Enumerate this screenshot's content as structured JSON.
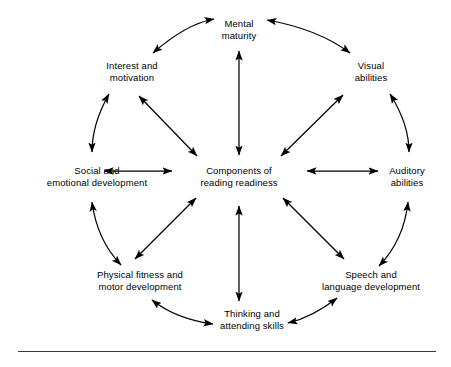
{
  "diagram": {
    "title": "Components of reading readiness",
    "type": "hub-and-spoke wheel",
    "center": {
      "id": "center",
      "line1": "Components of",
      "line2": "reading readiness",
      "x": 239,
      "y": 177
    },
    "nodes": [
      {
        "id": "mental-maturity",
        "line1": "Mental",
        "line2": "maturity",
        "x": 239,
        "y": 30,
        "angle": 90
      },
      {
        "id": "visual-abilities",
        "line1": "Visual",
        "line2": "abilities",
        "x": 371,
        "y": 72,
        "angle": 45
      },
      {
        "id": "auditory-abilities",
        "line1": "Auditory",
        "line2": "abilities",
        "x": 407,
        "y": 177,
        "angle": 0
      },
      {
        "id": "speech-language",
        "line1": "Speech and",
        "line2": "language development",
        "x": 371,
        "y": 281,
        "angle": -45
      },
      {
        "id": "thinking-attending",
        "line1": "Thinking and",
        "line2": "attending skills",
        "x": 252,
        "y": 320,
        "angle": -90
      },
      {
        "id": "physical-fitness",
        "line1": "Physical fitness and",
        "line2": "motor development",
        "x": 140,
        "y": 281,
        "angle": -135
      },
      {
        "id": "social-emotional",
        "line1": "Social and",
        "line2": "emotional development",
        "x": 111,
        "y": 177,
        "angle": 180
      },
      {
        "id": "interest-motivation",
        "line1": "Interest and",
        "line2": "motivation",
        "x": 131,
        "y": 72,
        "angle": 135
      }
    ],
    "spokes": [
      {
        "from": "center",
        "to": "mental-maturity",
        "style": "straight",
        "arrowheads": "both"
      },
      {
        "from": "center",
        "to": "visual-abilities",
        "style": "straight",
        "arrowheads": "both"
      },
      {
        "from": "center",
        "to": "auditory-abilities",
        "style": "straight",
        "arrowheads": "both"
      },
      {
        "from": "center",
        "to": "speech-language",
        "style": "straight",
        "arrowheads": "both"
      },
      {
        "from": "center",
        "to": "thinking-attending",
        "style": "straight",
        "arrowheads": "both"
      },
      {
        "from": "center",
        "to": "physical-fitness",
        "style": "straight",
        "arrowheads": "both"
      },
      {
        "from": "center",
        "to": "social-emotional",
        "style": "straight",
        "arrowheads": "both"
      },
      {
        "from": "center",
        "to": "interest-motivation",
        "style": "straight",
        "arrowheads": "both"
      }
    ],
    "ring_arcs": [
      {
        "from": "interest-motivation",
        "to": "mental-maturity",
        "style": "curved",
        "arrowheads": "both"
      },
      {
        "from": "mental-maturity",
        "to": "visual-abilities",
        "style": "curved",
        "arrowheads": "both"
      },
      {
        "from": "visual-abilities",
        "to": "auditory-abilities",
        "style": "curved",
        "arrowheads": "both"
      },
      {
        "from": "auditory-abilities",
        "to": "speech-language",
        "style": "curved",
        "arrowheads": "both"
      },
      {
        "from": "speech-language",
        "to": "thinking-attending",
        "style": "curved",
        "arrowheads": "both"
      },
      {
        "from": "thinking-attending",
        "to": "physical-fitness",
        "style": "curved",
        "arrowheads": "both"
      },
      {
        "from": "physical-fitness",
        "to": "social-emotional",
        "style": "curved",
        "arrowheads": "both"
      },
      {
        "from": "social-emotional",
        "to": "interest-motivation",
        "style": "curved",
        "arrowheads": "both"
      }
    ],
    "colors": {
      "stroke": "#000000",
      "text": "#000000",
      "background": "#ffffff",
      "rule": "#3a3a3a"
    }
  }
}
